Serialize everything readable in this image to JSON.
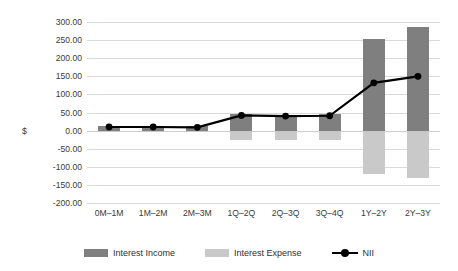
{
  "chart_data": {
    "type": "bar",
    "title": "",
    "xlabel": "",
    "ylabel": "$",
    "ylim": [
      -200,
      300
    ],
    "ytick_step": 50,
    "grid": true,
    "legend_position": "bottom",
    "categories": [
      "0M–1M",
      "1M–2M",
      "2M–3M",
      "1Q–2Q",
      "2Q–3Q",
      "3Q–4Q",
      "1Y–2Y",
      "2Y–3Y"
    ],
    "ytick_labels": [
      "300.00",
      "250.00",
      "200.00",
      "150.00",
      "100.00",
      "50.00",
      "0.00",
      "-50.00",
      "-100.00",
      "-150.00",
      "-200.00"
    ],
    "series": [
      {
        "name": "Interest Income",
        "type": "bar",
        "color": "#7f7f7f",
        "values": [
          13,
          13,
          12,
          45,
          44,
          45,
          252,
          287
        ]
      },
      {
        "name": "Interest Expense",
        "type": "bar",
        "color": "#c9c9c9",
        "values": [
          -3,
          -3,
          -3,
          -25,
          -25,
          -25,
          -120,
          -130
        ]
      },
      {
        "name": "NII",
        "type": "line",
        "color": "#000000",
        "values": [
          10,
          10,
          9,
          42,
          40,
          41,
          132,
          150
        ]
      }
    ]
  },
  "legend": {
    "items": [
      {
        "label": "Interest Income",
        "marker": "bar-swatch-dark"
      },
      {
        "label": "Interest Expense",
        "marker": "bar-swatch-light"
      },
      {
        "label": "NII",
        "marker": "line-with-dot"
      }
    ]
  },
  "colors": {
    "income": "#7f7f7f",
    "expense": "#c9c9c9",
    "nii_line": "#000000",
    "gridline": "#d9d9d9",
    "text": "#3a3a3a",
    "background": "#ffffff"
  }
}
